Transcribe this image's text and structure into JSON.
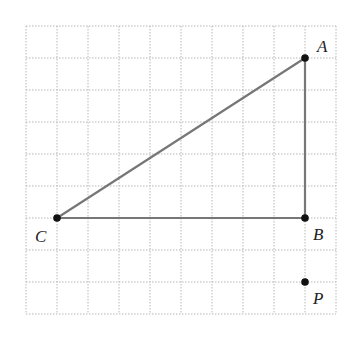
{
  "diagram": {
    "grid": {
      "origin_x": 26,
      "origin_y": 26,
      "cell_w": 31,
      "cell_h": 32,
      "cols": 10,
      "rows": 9,
      "line_color": "#b8b8b8"
    },
    "points": [
      {
        "name": "A",
        "col": 9,
        "row": 1,
        "label_dx": 12,
        "label_dy": -6
      },
      {
        "name": "B",
        "col": 9,
        "row": 6,
        "label_dx": 8,
        "label_dy": 22
      },
      {
        "name": "C",
        "col": 1,
        "row": 6,
        "label_dx": -22,
        "label_dy": 24
      },
      {
        "name": "P",
        "col": 9,
        "row": 8,
        "label_dx": 8,
        "label_dy": 22
      }
    ],
    "segments": [
      [
        "A",
        "B"
      ],
      [
        "B",
        "C"
      ],
      [
        "C",
        "A"
      ]
    ],
    "segment_color": "#777777",
    "point_color": "#111111"
  }
}
